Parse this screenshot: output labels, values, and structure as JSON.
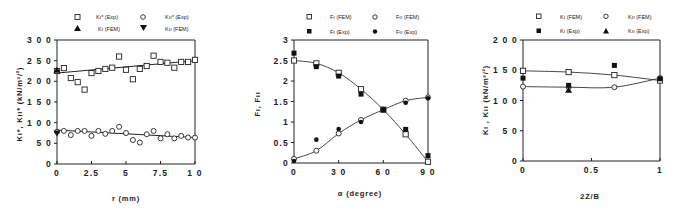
{
  "chart_data": [
    {
      "type": "scatter",
      "title": "",
      "xlabel": "r  (mm)",
      "ylabel": "Kı*, Kıı*  (kN/m3/2)",
      "xlim": [
        0,
        10
      ],
      "ylim": [
        0,
        300
      ],
      "xticks": [
        "0",
        "2.5",
        "5",
        "7.5",
        "10"
      ],
      "yticks": [
        "0",
        "50",
        "100",
        "150",
        "200",
        "250",
        "300"
      ],
      "grid": false,
      "legend_position": "top",
      "legend": [
        "Kı* (Exp)",
        "Kıı* (Exp)",
        "Kı (FEM)",
        "Kıı (FEM)"
      ],
      "series": [
        {
          "name": "Kı* (Exp)",
          "marker": "open-square",
          "x": [
            0,
            0.5,
            1,
            1.5,
            2,
            2.5,
            3,
            3.5,
            4,
            4.5,
            5,
            5.5,
            6,
            6.5,
            7,
            7.5,
            8,
            8.5,
            9,
            9.5,
            10
          ],
          "y": [
            225,
            232,
            208,
            198,
            180,
            220,
            225,
            230,
            233,
            260,
            228,
            205,
            230,
            237,
            262,
            247,
            245,
            233,
            247,
            247,
            252
          ]
        },
        {
          "name": "Kıı* (Exp)",
          "marker": "open-circle",
          "x": [
            0,
            0.5,
            1,
            1.5,
            2,
            2.5,
            3,
            3.5,
            4,
            4.5,
            5,
            5.5,
            6,
            6.5,
            7,
            7.5,
            8,
            8.5,
            9,
            9.5,
            10
          ],
          "y": [
            78,
            80,
            70,
            80,
            80,
            68,
            80,
            73,
            80,
            90,
            75,
            58,
            52,
            72,
            80,
            62,
            72,
            62,
            68,
            64,
            64
          ]
        },
        {
          "name": "Kı (FEM)",
          "marker": "filled-triangle-up",
          "x": [
            0
          ],
          "y": [
            227
          ]
        },
        {
          "name": "Kıı (FEM)",
          "marker": "filled-triangle-down",
          "x": [
            0
          ],
          "y": [
            75
          ]
        },
        {
          "name": "Kı trend",
          "marker": "line",
          "x": [
            0,
            10
          ],
          "y": [
            220,
            250
          ]
        },
        {
          "name": "Kıı trend",
          "marker": "line",
          "x": [
            0,
            10
          ],
          "y": [
            82,
            64
          ]
        }
      ]
    },
    {
      "type": "line",
      "title": "",
      "xlabel": "α  (degree)",
      "ylabel": "Fı, Fıı",
      "xlim": [
        0,
        90
      ],
      "ylim": [
        0,
        3
      ],
      "xticks": [
        "0",
        "30",
        "60",
        "90"
      ],
      "yticks": [
        "0",
        "0.5",
        "1",
        "1.5",
        "2",
        "2.5",
        "3"
      ],
      "grid": false,
      "legend_position": "top",
      "legend": [
        "Fı (FEM)",
        "Fıı (FEM)",
        "Fı (Exp)",
        "Fıı (Exp)"
      ],
      "series": [
        {
          "name": "Fı (FEM)",
          "marker": "open-square-line",
          "x": [
            0,
            15,
            30,
            45,
            60,
            75,
            90
          ],
          "y": [
            2.5,
            2.43,
            2.2,
            1.8,
            1.3,
            0.7,
            0.03
          ]
        },
        {
          "name": "Fıı (FEM)",
          "marker": "open-circle-line",
          "x": [
            0,
            15,
            30,
            45,
            60,
            75,
            90
          ],
          "y": [
            0.1,
            0.3,
            0.72,
            1.05,
            1.3,
            1.52,
            1.6
          ]
        },
        {
          "name": "Fı (Exp)",
          "marker": "filled-square",
          "x": [
            0,
            15,
            30,
            45,
            60,
            75,
            90
          ],
          "y": [
            2.68,
            2.35,
            2.12,
            1.68,
            1.3,
            0.82,
            0.18
          ]
        },
        {
          "name": "Fıı (Exp)",
          "marker": "filled-circle",
          "x": [
            0,
            15,
            30,
            45,
            60,
            75,
            90
          ],
          "y": [
            0.05,
            0.57,
            0.83,
            1.0,
            1.3,
            1.47,
            1.58
          ]
        }
      ]
    },
    {
      "type": "line",
      "title": "",
      "xlabel": "2Z/B",
      "ylabel": "Kı , Kıı  (kN/m3/2)",
      "xlim": [
        0,
        1
      ],
      "ylim": [
        0,
        200
      ],
      "xticks": [
        "0",
        "0.5",
        "1"
      ],
      "yticks": [
        "0",
        "50",
        "100",
        "150",
        "200"
      ],
      "grid": false,
      "legend_position": "top",
      "legend": [
        "Kı (FEM)",
        "Kıı (FEM)",
        "Kı (Exp)",
        "Kıı (Exp)"
      ],
      "series": [
        {
          "name": "Kı (FEM)",
          "marker": "open-square-line",
          "x": [
            0,
            0.333,
            0.667,
            1
          ],
          "y": [
            149,
            147,
            142,
            133
          ]
        },
        {
          "name": "Kıı (FEM)",
          "marker": "open-circle-line",
          "x": [
            0,
            0.333,
            0.667,
            1
          ],
          "y": [
            123,
            122,
            122,
            137
          ]
        },
        {
          "name": "Kı (Exp)",
          "marker": "filled-square",
          "x": [
            0,
            0.333,
            0.667,
            1
          ],
          "y": [
            137,
            125,
            158,
            136
          ]
        },
        {
          "name": "Kıı (Exp)",
          "marker": "filled-triangle-up",
          "x": [
            0.333
          ],
          "y": [
            117
          ]
        }
      ]
    }
  ],
  "panels": [
    {
      "legend": [
        "Kı* (Exp)",
        "Kıı* (Exp)",
        "Kı (FEM)",
        "Kıı (FEM)"
      ],
      "xlabel": "r  (mm)",
      "ylabel": "Kı*, Kıı*  (kN/m³/²)",
      "xticks": [
        "0",
        "2.5",
        "5",
        "7.5",
        "1 0"
      ],
      "yticks": [
        "0",
        "5 0",
        "1 0 0",
        "1 5 0",
        "2 0 0",
        "2 5 0",
        "3 0 0"
      ]
    },
    {
      "legend": [
        "Fı (FEM)",
        "Fıı (FEM)",
        "Fı (Exp)",
        "Fıı (Exp)"
      ],
      "xlabel": "α  (degree)",
      "ylabel": "Fı, Fıı",
      "xticks": [
        "0",
        "3 0",
        "6 0",
        "9 0"
      ],
      "yticks": [
        "0",
        "0.5",
        "1",
        "1.5",
        "2",
        "2.5",
        "3"
      ]
    },
    {
      "legend": [
        "Kı (FEM)",
        "Kıı (FEM)",
        "Kı (Exp)",
        "Kıı (Exp)"
      ],
      "xlabel": "2Z/B",
      "ylabel": "Kı , Kıı  (kN/m³/²)",
      "xticks": [
        "0",
        "0.5",
        "1"
      ],
      "yticks": [
        "0",
        "5 0",
        "1 0 0",
        "1 5 0",
        "2 0 0"
      ]
    }
  ],
  "colors": {
    "ink": "#222222",
    "background": "#ffffff"
  }
}
